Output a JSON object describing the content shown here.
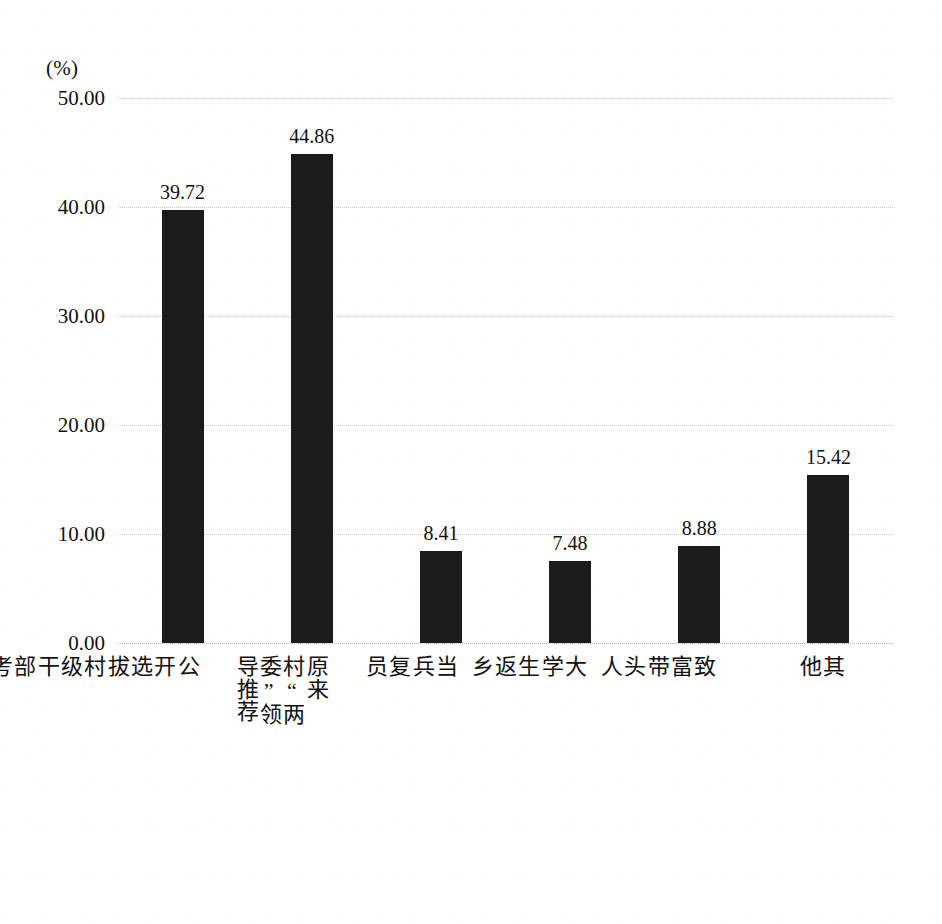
{
  "chart_data": {
    "type": "bar",
    "title": "",
    "subtitle": "",
    "xlabel": "",
    "ylabel": "(%)",
    "unit_label": "(%)",
    "ylim": [
      0,
      50
    ],
    "ytick_step": 10,
    "grid": true,
    "legend": false,
    "bar_color": "#1b1b1b",
    "gridline_color": "#c9c9c9",
    "categories": [
      "公开选拔村级干部考试",
      "原来村“两委”领导推荐",
      "当兵复员",
      "大学生返乡",
      "致富带头人",
      "其他"
    ],
    "values": [
      39.72,
      44.86,
      8.41,
      7.48,
      8.88,
      15.42
    ],
    "value_labels": [
      "39.72",
      "44.86",
      "8.41",
      "7.48",
      "8.88",
      "15.42"
    ],
    "ytick_labels": [
      "0.00",
      "10.00",
      "20.00",
      "30.00",
      "40.00",
      "50.00"
    ],
    "ytick_values": [
      0,
      10,
      20,
      30,
      40,
      50
    ]
  }
}
